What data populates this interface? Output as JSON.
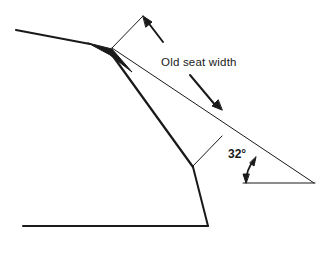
{
  "diagram": {
    "title": "",
    "labels": {
      "seat_width": "Old seat width",
      "angle": "32°"
    },
    "angle_degrees": 32,
    "colors": {
      "line": "#1a1a1a",
      "background": "#ffffff"
    }
  }
}
